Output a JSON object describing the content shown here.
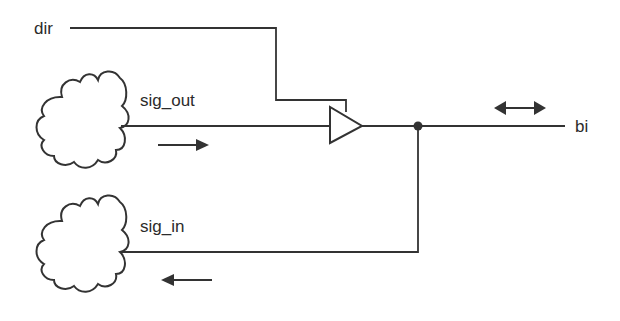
{
  "diagram": {
    "type": "bidirectional-buffer-schematic",
    "labels": {
      "dir": "dir",
      "sig_out": "sig_out",
      "sig_in": "sig_in",
      "bi": "bi"
    },
    "colors": {
      "line": "#333333",
      "text": "#2b2b2b",
      "background": "#ffffff"
    },
    "elements": [
      {
        "id": "cloud-sig-out",
        "kind": "cloud",
        "role": "source logic"
      },
      {
        "id": "cloud-sig-in",
        "kind": "cloud",
        "role": "sink logic"
      },
      {
        "id": "tristate-buffer",
        "kind": "triangle-buffer",
        "enable": "dir"
      },
      {
        "id": "junction",
        "kind": "dot"
      },
      {
        "id": "arrow-right",
        "kind": "direction-arrow",
        "direction": "right"
      },
      {
        "id": "arrow-left",
        "kind": "direction-arrow",
        "direction": "left"
      },
      {
        "id": "arrow-bidirectional",
        "kind": "direction-arrow",
        "direction": "both"
      }
    ]
  }
}
